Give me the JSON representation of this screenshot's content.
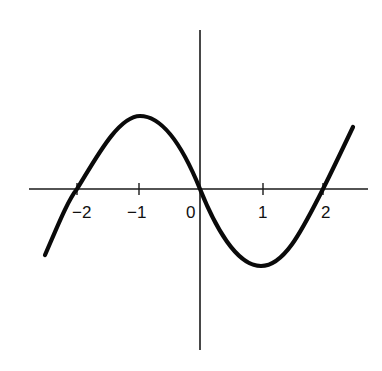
{
  "chart_data": {
    "type": "line",
    "title": "",
    "xlabel": "",
    "ylabel": "",
    "function_shape": "cubic with roots at -2, 0, 2; local max near x=-1, local min near x=1",
    "x_ticks": [
      -2,
      -1,
      0,
      1,
      2
    ],
    "x_tick_labels": [
      "−2",
      "−1",
      "0",
      "1",
      "2"
    ],
    "y_ticks": [],
    "xlim": [
      -2.75,
      2.7
    ],
    "roots": [
      -2,
      0,
      2
    ],
    "local_max": {
      "x": -1,
      "y": 3
    },
    "local_min": {
      "x": 1,
      "y": -3
    },
    "series": [
      {
        "name": "f(x)",
        "x": [
          -2.5,
          -2.0,
          -1.5,
          -1.0,
          -0.5,
          0.0,
          0.5,
          1.0,
          1.5,
          2.0,
          2.5
        ],
        "y": [
          -2.7,
          0,
          2.3,
          3.0,
          2.2,
          0,
          -2.2,
          -3.0,
          -2.3,
          0,
          2.5
        ]
      }
    ],
    "grid": false,
    "legend": "none"
  },
  "layout": {
    "origin_px": [
      200,
      189
    ],
    "unit_px_x": 61.5,
    "unit_px_y": 24.5,
    "x_axis_px": [
      29,
      368
    ],
    "y_axis_px": [
      30,
      350
    ],
    "curve_path": "M45,255 C58,225 68,200 77,189 C95,160 118,116 140,116 C165,116 185,152 200,189 C214,224 236,266 261,266 C285,266 303,228 323,189 C333,169 343,148 353,127",
    "colors": {
      "curve": "#0a0a0a",
      "axis": "#1a1a1a",
      "background": "#ffffff",
      "bleed_text": "#e6e6e6"
    }
  },
  "tick_labels": [
    {
      "text": "−2",
      "left": 72,
      "top": 204
    },
    {
      "text": "−1",
      "left": 127,
      "top": 204
    },
    {
      "text": "0",
      "left": 186,
      "top": 204
    },
    {
      "text": "1",
      "left": 258,
      "top": 204
    },
    {
      "text": "2",
      "left": 321,
      "top": 204
    }
  ]
}
